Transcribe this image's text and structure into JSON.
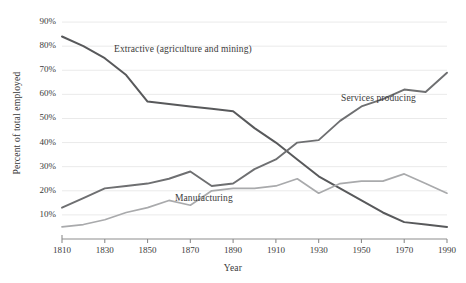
{
  "chart_data": {
    "type": "line",
    "title": "",
    "xlabel": "Year",
    "ylabel": "Percent of total employed",
    "x": [
      1810,
      1820,
      1830,
      1840,
      1850,
      1860,
      1870,
      1880,
      1890,
      1900,
      1910,
      1920,
      1930,
      1940,
      1950,
      1960,
      1970,
      1980,
      1990
    ],
    "xlim": [
      1810,
      1990
    ],
    "ylim": [
      0,
      95
    ],
    "xticks": [
      1810,
      1830,
      1850,
      1870,
      1890,
      1910,
      1930,
      1950,
      1970,
      1990
    ],
    "xtick_labels": [
      "1810",
      "1830",
      "1850",
      "1870",
      "1890",
      "1910",
      "1930",
      "1950",
      "1970",
      "1990"
    ],
    "yticks": [
      10,
      20,
      30,
      40,
      50,
      60,
      70,
      80,
      90
    ],
    "ytick_labels": [
      "10%",
      "20%",
      "30%",
      "40%",
      "50%",
      "60%",
      "70%",
      "80%",
      "90%"
    ],
    "grid": "horizontal",
    "legend": "inline-annotations",
    "series": [
      {
        "name": "Extractive (agriculture and mining)",
        "color": "#58595b",
        "label_position": "inline",
        "values": [
          84,
          80,
          75,
          68,
          57,
          56,
          55,
          54,
          53,
          46,
          40,
          33,
          26,
          21,
          16,
          11,
          7,
          6,
          5
        ]
      },
      {
        "name": "Services producing",
        "color": "#6e6f71",
        "label_position": "inline",
        "values": [
          13,
          17,
          21,
          22,
          23,
          25,
          28,
          22,
          23,
          29,
          33,
          40,
          41,
          49,
          55,
          58,
          62,
          61,
          69
        ]
      },
      {
        "name": "Manufacturing",
        "color": "#a9aaac",
        "label_position": "inline",
        "values": [
          5,
          6,
          8,
          11,
          13,
          16,
          14,
          20,
          21,
          21,
          22,
          25,
          19,
          23,
          24,
          24,
          27,
          23,
          19
        ]
      }
    ]
  },
  "labels": {
    "y_axis_title": "Percent of total employed",
    "x_axis_title": "Year",
    "extractive": "Extractive (agriculture and mining)",
    "services": "Services producing",
    "manufacturing": "Manufacturing"
  },
  "colors": {
    "extractive": "#58595b",
    "services": "#6e6f71",
    "manufacturing": "#a9aaac",
    "axis": "#8d8d8d",
    "grid": "#eaeaea",
    "text": "#3a3a3a",
    "background": "#ffffff"
  }
}
